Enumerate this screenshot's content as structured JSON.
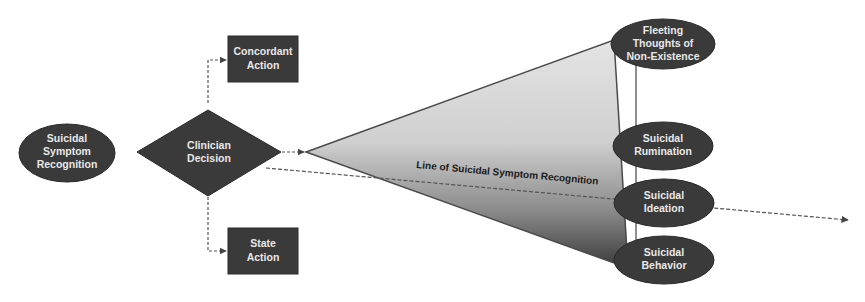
{
  "diagram": {
    "nodes": {
      "recognition": {
        "line1": "Suicidal",
        "line2": "Symptom",
        "line3": "Recognition",
        "shape": "ellipse"
      },
      "decision": {
        "line1": "Clinician",
        "line2": "Decision",
        "shape": "diamond"
      },
      "concordant": {
        "line1": "Concordant",
        "line2": "Action",
        "shape": "rectangle"
      },
      "state": {
        "line1": "State",
        "line2": "Action",
        "shape": "rectangle"
      },
      "fleeting": {
        "line1": "Fleeting",
        "line2": "Thoughts of",
        "line3": "Non-Existence",
        "shape": "ellipse"
      },
      "rumination": {
        "line1": "Suicidal",
        "line2": "Rumination",
        "shape": "ellipse"
      },
      "ideation": {
        "line1": "Suicidal",
        "line2": "Ideation",
        "shape": "ellipse"
      },
      "behavior": {
        "line1": "Suicidal",
        "line2": "Behavior",
        "shape": "ellipse"
      }
    },
    "recognition_line_label": "Line of Suicidal Symptom Recognition",
    "colors": {
      "node_fill": "#3a3a3a",
      "node_text": "#e8e8e8",
      "gradient_top": "#e2e2e2",
      "gradient_bottom": "#3c3c3c",
      "connector": "#555555"
    }
  }
}
